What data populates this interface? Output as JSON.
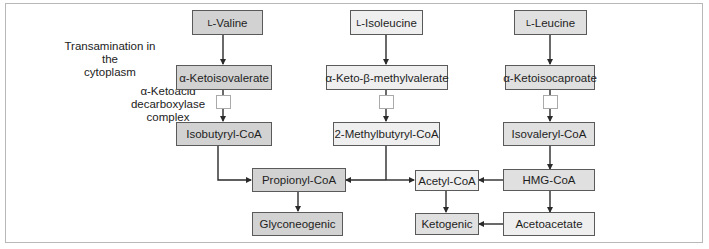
{
  "diagram": {
    "annotations": {
      "transamination": [
        "Transamination in the",
        "cytoplasm"
      ],
      "decarboxylase": [
        "α-Ketoacid",
        "decarboxylase",
        "complex"
      ]
    },
    "valine_path": {
      "amino_acid_prefix": "L",
      "amino_acid": "-Valine",
      "keto_acid": "α-Ketoisovalerate",
      "acyl_coa": "Isobutyryl-CoA"
    },
    "isoleucine_path": {
      "amino_acid_prefix": "L",
      "amino_acid": "-Isoleucine",
      "keto_acid": "α-Keto-β-methylvalerate",
      "acyl_coa": "2-Methylbutyryl-CoA"
    },
    "leucine_path": {
      "amino_acid_prefix": "L",
      "amino_acid": "-Leucine",
      "keto_acid": "α-Ketoisocaproate",
      "acyl_coa": "Isovaleryl-CoA",
      "hmg": "HMG-CoA",
      "acetoacetate": "Acetoacetate"
    },
    "products": {
      "propionyl": "Propionyl-CoA",
      "acetyl": "Acetyl-CoA",
      "glyconeogenic": "Glyconeogenic",
      "ketogenic": "Ketogenic"
    },
    "colors": {
      "valine_fill": "#d2d2d2",
      "leucine_fill": "#e0e0e0",
      "isoleucine_fill": "#efefef",
      "arrow": "#2a2a2a",
      "frame": "#b8b8b8"
    }
  }
}
